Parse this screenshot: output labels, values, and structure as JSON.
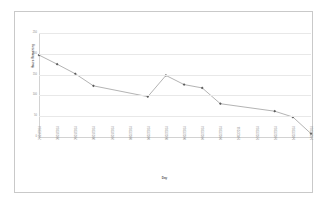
{
  "chart_data": {
    "type": "line",
    "title": "",
    "xlabel": "Day",
    "ylabel": "Hours Remaining",
    "ylim": [
      0,
      250
    ],
    "y_ticks": [
      0,
      50,
      100,
      150,
      200,
      250
    ],
    "grid": true,
    "legend": "none",
    "marker": "diamond",
    "line_color": "#808080",
    "marker_color": "#5a5a5a",
    "grid_color": "#e8e8e8",
    "categories": [
      "27/01/2014",
      "28/01/2014",
      "29/01/2014",
      "30/01/2014",
      "31/01/2014",
      "03/02/2014",
      "04/02/2014",
      "05/02/2014",
      "06/02/2014",
      "07/02/2014",
      "10/02/2014",
      "11/02/2014",
      "12/02/2014",
      "13/02/2014",
      "14/02/2014",
      "17/02/2014"
    ],
    "series": [
      {
        "name": "Hours Remaining",
        "values": [
          197,
          175,
          152,
          123,
          null,
          null,
          97,
          148,
          126,
          118,
          80,
          null,
          null,
          62,
          48,
          8
        ]
      }
    ]
  },
  "axis": {
    "y_title": "Hours Remaining",
    "x_title": "Day"
  }
}
